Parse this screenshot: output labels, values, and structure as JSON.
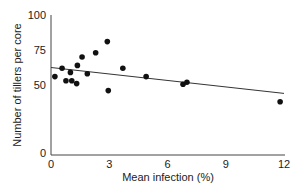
{
  "chart_data": {
    "type": "scatter",
    "title": "",
    "xlabel": "Mean infection (%)",
    "ylabel": "Number of tillers per core",
    "xlim": [
      0,
      12
    ],
    "ylim": [
      0,
      100
    ],
    "xticks": [
      0,
      3,
      6,
      9,
      12
    ],
    "yticks": [
      0,
      25,
      50,
      75,
      100
    ],
    "ytick_labels_shown": [
      "0",
      "50",
      "75",
      "100"
    ],
    "grid": false,
    "legend": null,
    "series": [
      {
        "name": "observations",
        "marker": "filled-circle",
        "color": "#111111",
        "points": [
          {
            "x": 0.2,
            "y": 56
          },
          {
            "x": 0.57,
            "y": 62
          },
          {
            "x": 0.77,
            "y": 53
          },
          {
            "x": 1.0,
            "y": 59
          },
          {
            "x": 1.07,
            "y": 53
          },
          {
            "x": 1.32,
            "y": 51
          },
          {
            "x": 1.36,
            "y": 64
          },
          {
            "x": 1.6,
            "y": 70
          },
          {
            "x": 1.87,
            "y": 58
          },
          {
            "x": 2.3,
            "y": 73
          },
          {
            "x": 2.9,
            "y": 81
          },
          {
            "x": 2.95,
            "y": 46
          },
          {
            "x": 3.7,
            "y": 62
          },
          {
            "x": 4.9,
            "y": 56
          },
          {
            "x": 6.8,
            "y": 50.5
          },
          {
            "x": 7.0,
            "y": 52
          },
          {
            "x": 11.8,
            "y": 38
          }
        ]
      },
      {
        "name": "regression line",
        "type": "line",
        "color": "#333333",
        "points": [
          {
            "x": 0,
            "y": 62.5
          },
          {
            "x": 12,
            "y": 44
          }
        ]
      }
    ]
  }
}
